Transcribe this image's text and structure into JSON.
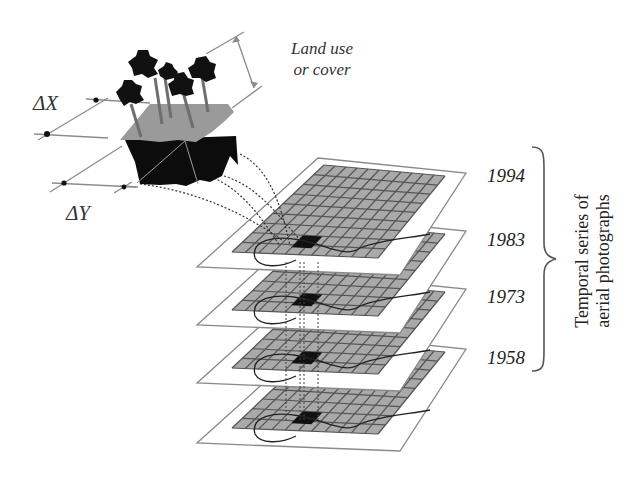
{
  "diagram": {
    "land_label_line1": "Land use",
    "land_label_line2": "or cover",
    "delta_x": "ΔX",
    "delta_y": "ΔY",
    "series_label_line1": "Temporal series of",
    "series_label_line2": "aerial photographs",
    "layers": [
      {
        "year": "1994"
      },
      {
        "year": "1983"
      },
      {
        "year": "1973"
      },
      {
        "year": "1958"
      }
    ],
    "colors": {
      "sheet": "#ffffff",
      "sheet_border": "#8a8a8a",
      "grid_fill": "#a9a9a9",
      "grid_lines": "#555555",
      "highlight_cell": "#111111",
      "soil_block": "#0c0c0c",
      "surface": "#9a9a9a",
      "tree": "#111111"
    }
  }
}
